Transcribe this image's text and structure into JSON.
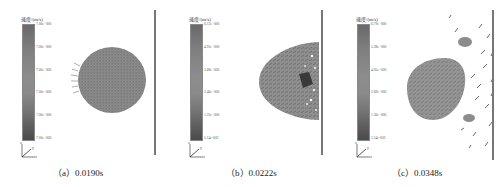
{
  "figure": {
    "legend_title": "速度/(m/s)",
    "panels": [
      {
        "label": "（a）0.0190s",
        "ticks": [
          "7.00e+000",
          "7.00e+000",
          "7.00e+000",
          "7.00e+000",
          "7.00e+000",
          "7.00e+000"
        ]
      },
      {
        "label": "（b）0.0222s",
        "ticks": [
          "6.12e+000",
          "4.91e+000",
          "3.68e+000",
          "2.46e+000",
          "1.25e+000",
          "5.14e-002"
        ]
      },
      {
        "label": "（c）0.0348s",
        "ticks": [
          "6.79e+000",
          "5.38e+000",
          "4.05e+000",
          "2.69e+000",
          "1.36e+000",
          "1.54e-002"
        ]
      }
    ],
    "axis_labels": {
      "z": "z",
      "y": "y",
      "x": "x"
    }
  }
}
